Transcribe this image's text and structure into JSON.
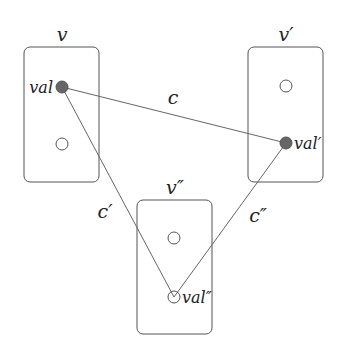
{
  "diagram": {
    "vertices": [
      {
        "id": "v",
        "label": "v",
        "box": {
          "x": 24,
          "y": 47,
          "w": 75,
          "h": 135
        },
        "label_pos": {
          "x": 62,
          "y": 41
        }
      },
      {
        "id": "v1",
        "label": "v′",
        "box": {
          "x": 248,
          "y": 47,
          "w": 75,
          "h": 135
        },
        "label_pos": {
          "x": 286,
          "y": 41
        }
      },
      {
        "id": "v2",
        "label": "v″",
        "box": {
          "x": 137,
          "y": 200,
          "w": 75,
          "h": 134
        },
        "label_pos": {
          "x": 175,
          "y": 194
        }
      }
    ],
    "nodes": [
      {
        "id": "val",
        "vertex": "v",
        "x": 62,
        "y": 87,
        "filled": true,
        "label": "val",
        "label_side": "left"
      },
      {
        "id": "v_empty",
        "vertex": "v",
        "x": 62,
        "y": 144,
        "filled": false,
        "label": ""
      },
      {
        "id": "v1_empty",
        "vertex": "v1",
        "x": 286,
        "y": 86,
        "filled": false,
        "label": ""
      },
      {
        "id": "val1",
        "vertex": "v1",
        "x": 286,
        "y": 143,
        "filled": true,
        "label": "val′",
        "label_side": "right"
      },
      {
        "id": "v2_empty",
        "vertex": "v2",
        "x": 174,
        "y": 238,
        "filled": false,
        "label": ""
      },
      {
        "id": "val2",
        "vertex": "v2",
        "x": 174,
        "y": 297,
        "filled": false,
        "label": "val″",
        "label_side": "right"
      }
    ],
    "edges": [
      {
        "id": "c",
        "from": "val",
        "to": "val1",
        "label": "c",
        "label_pos": {
          "x": 173,
          "y": 104
        }
      },
      {
        "id": "c1",
        "from": "val",
        "to": "val2",
        "label": "c′",
        "label_pos": {
          "x": 105,
          "y": 218
        }
      },
      {
        "id": "c2",
        "from": "val1",
        "to": "val2",
        "label": "c″",
        "label_pos": {
          "x": 258,
          "y": 222
        }
      }
    ]
  }
}
